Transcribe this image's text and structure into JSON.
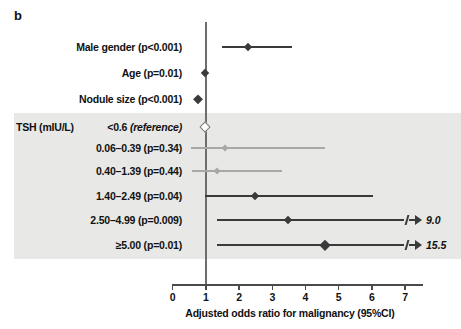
{
  "panel": {
    "letter": "b"
  },
  "axis": {
    "title": "Adjusted odds ratio for malignancy (95%CI)",
    "ticks": [
      {
        "value": 0,
        "label": "0"
      },
      {
        "value": 1,
        "label": "1"
      },
      {
        "value": 2,
        "label": "2"
      },
      {
        "value": 3,
        "label": "3"
      },
      {
        "value": 4,
        "label": "4"
      },
      {
        "value": 5,
        "label": "5"
      },
      {
        "value": 6,
        "label": "6"
      },
      {
        "value": 7,
        "label": "7"
      }
    ],
    "reference_line_value": 1
  },
  "groups": [
    {
      "label": "TSH (mIU/L)",
      "first_row_index": 3
    }
  ],
  "chart_data": {
    "type": "forest",
    "title": "b",
    "xlabel": "Adjusted odds ratio for malignancy (95%CI)",
    "ylabel": "",
    "xlim": [
      0,
      7.6
    ],
    "xticks": [
      0,
      1,
      2,
      3,
      4,
      5,
      6,
      7
    ],
    "reference_line": 1,
    "grid": false,
    "legend": "none",
    "rows": [
      {
        "label": "Male gender (p<0.001)",
        "p_value": "p<0.001",
        "or": 2.3,
        "ci_low": 1.5,
        "ci_high": 3.6,
        "truncated": false,
        "reference": false,
        "shaded": false,
        "style": "dark"
      },
      {
        "label": "Age (p=0.01)",
        "p_value": "p=0.01",
        "or": 0.98,
        "ci_low": 0.95,
        "ci_high": 1.0,
        "truncated": false,
        "reference": false,
        "shaded": false,
        "style": "dark"
      },
      {
        "label": "Nodule size (p<0.001)",
        "p_value": "p<0.001",
        "or": 0.78,
        "ci_low": 0.74,
        "ci_high": 0.82,
        "truncated": false,
        "reference": false,
        "shaded": false,
        "style": "dark"
      },
      {
        "label": "<0.6 (reference)",
        "label_plain": "<0.6 ",
        "label_italic": "(reference)",
        "p_value": "",
        "or": 1.0,
        "ci_low": 1.0,
        "ci_high": 1.0,
        "truncated": false,
        "reference": true,
        "shaded": true,
        "style": "open"
      },
      {
        "label": "0.06–0.39 (p=0.34)",
        "p_value": "p=0.34",
        "or": 1.6,
        "ci_low": 0.57,
        "ci_high": 4.6,
        "truncated": false,
        "reference": false,
        "shaded": true,
        "style": "light"
      },
      {
        "label": "0.40–1.39 (p=0.44)",
        "p_value": "p=0.44",
        "or": 1.35,
        "ci_low": 0.6,
        "ci_high": 3.3,
        "truncated": false,
        "reference": false,
        "shaded": true,
        "style": "light"
      },
      {
        "label": "1.40–2.49 (p=0.04)",
        "p_value": "p=0.04",
        "or": 2.5,
        "ci_low": 1.0,
        "ci_high": 6.05,
        "truncated": false,
        "reference": false,
        "shaded": true,
        "style": "dark"
      },
      {
        "label": "2.50–4.99 (p=0.009)",
        "p_value": "p=0.009",
        "or": 3.5,
        "ci_low": 1.35,
        "ci_high": 9.0,
        "truncated": true,
        "truncated_label": "9.0",
        "reference": false,
        "shaded": true,
        "style": "dark"
      },
      {
        "label": "≥5.00 (p=0.01)",
        "p_value": "p=0.01",
        "or": 4.6,
        "ci_low": 1.35,
        "ci_high": 15.5,
        "truncated": true,
        "truncated_label": "15.5",
        "reference": false,
        "shaded": true,
        "style": "dark"
      }
    ]
  },
  "colors": {
    "dark_marker": "#3a3a3a",
    "light_marker": "#a8a8a8",
    "shade_band": "#e8e8e6",
    "axis": "#4a4a4a",
    "text": "#111111"
  }
}
